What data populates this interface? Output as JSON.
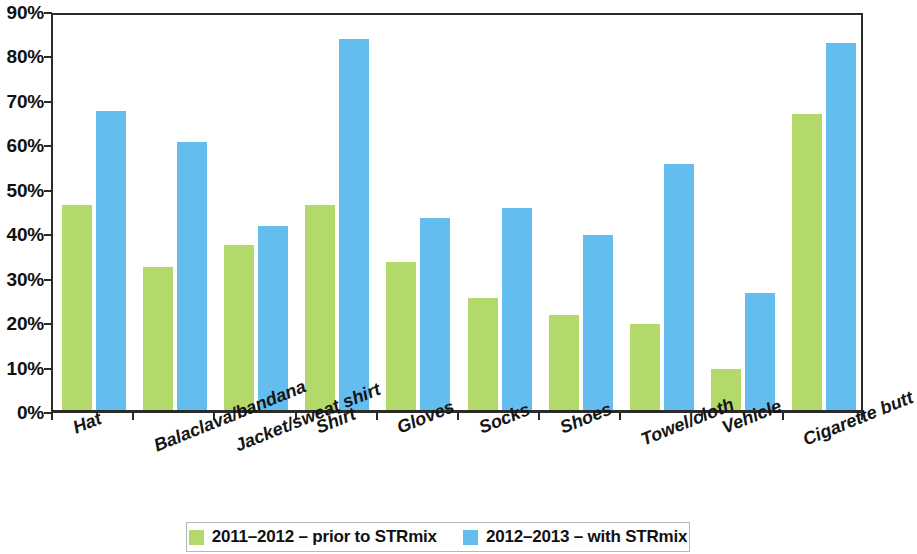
{
  "chart_data": {
    "type": "bar",
    "title": "",
    "subtitle": "",
    "xlabel": "",
    "ylabel": "",
    "ylim": [
      0,
      90
    ],
    "grid": false,
    "legend_position": "bottom",
    "categories": [
      "Hat",
      "Balaclava/bandana",
      "Jacket/sweat shirt",
      "Shirt",
      "Gloves",
      "Socks",
      "Shoes",
      "Towel/cloth",
      "Vehicle",
      "Cigarette butt"
    ],
    "ytick_labels": [
      "90%",
      "80%",
      "70%",
      "60%",
      "50%",
      "40%",
      "30%",
      "20%",
      "10%",
      "0%"
    ],
    "ytick_values": [
      90,
      80,
      70,
      60,
      50,
      40,
      30,
      20,
      10,
      0
    ],
    "series": [
      {
        "name": "2011–2012 – prior to STRmix",
        "color": "#b3d96b",
        "values": [
          46.2,
          32.2,
          37.2,
          46.2,
          33.2,
          25.3,
          21.3,
          19.3,
          9.3,
          66.5
        ]
      },
      {
        "name": "2012–2013 – with STRmix",
        "color": "#63bdee",
        "values": [
          67.3,
          60.3,
          41.3,
          83.5,
          43.3,
          45.5,
          39.3,
          55.3,
          26.3,
          82.5
        ]
      }
    ]
  },
  "legend": {
    "items": [
      {
        "label": "2011–2012 – prior to STRmix",
        "color": "#b3d96b"
      },
      {
        "label": "2012–2013 – with STRmix",
        "color": "#63bdee"
      }
    ]
  },
  "colors": {
    "series_prior": "#b3d96b",
    "series_with": "#63bdee",
    "axis": "#2b2b2b",
    "background": "#ffffff"
  }
}
